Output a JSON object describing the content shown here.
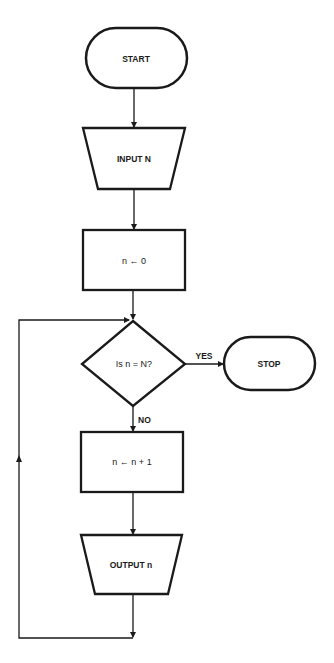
{
  "flowchart": {
    "nodes": {
      "start": {
        "type": "terminator",
        "label": "START"
      },
      "input": {
        "type": "input",
        "label": "INPUT N"
      },
      "init": {
        "type": "process",
        "label": "n ← 0"
      },
      "decision": {
        "type": "decision",
        "label": "Is n = N?"
      },
      "stop": {
        "type": "terminator",
        "label": "STOP"
      },
      "increment": {
        "type": "process",
        "label": "n ← n + 1"
      },
      "output": {
        "type": "output",
        "label": "OUTPUT n"
      }
    },
    "edge_labels": {
      "yes": "YES",
      "no": "NO"
    },
    "colors": {
      "stroke": "#1a1a1a",
      "background": "#ffffff"
    }
  }
}
